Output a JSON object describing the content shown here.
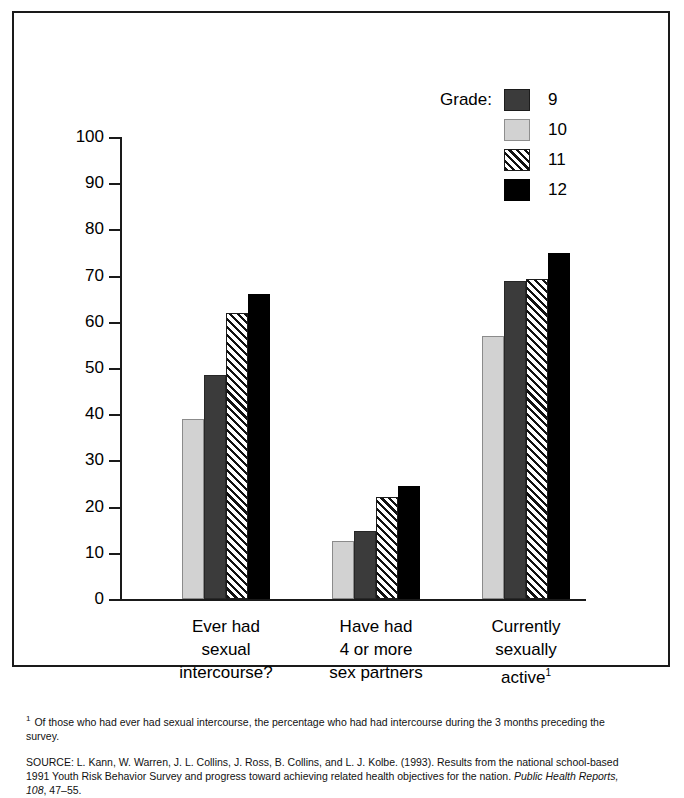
{
  "title": {
    "text_visible_tail": "Sexual Intercourse: Grade",
    "full_clipped": "Sexual Intercourse: Grade"
  },
  "legend": {
    "title": "Grade:",
    "entries": [
      {
        "label": "9",
        "swatch": "dark-gray-solid",
        "color": "#3b3b3b"
      },
      {
        "label": "10",
        "swatch": "light-gray-solid",
        "color": "#d2d2d2"
      },
      {
        "label": "11",
        "swatch": "diagonal-hatch",
        "color": "#ffffff"
      },
      {
        "label": "12",
        "swatch": "black-solid",
        "color": "#000000"
      }
    ]
  },
  "axis": {
    "y_ticks": [
      "100",
      "90",
      "80",
      "70",
      "60",
      "50",
      "40",
      "30",
      "20",
      "10",
      "0"
    ]
  },
  "categories": [
    {
      "line1": "Ever had",
      "line2": "sexual",
      "line3": "intercourse?",
      "sup": ""
    },
    {
      "line1": "Have had",
      "line2": "4 or more",
      "line3": "sex partners",
      "sup": ""
    },
    {
      "line1": "Currently",
      "line2": "sexually",
      "line3": "active",
      "sup": "1"
    }
  ],
  "footnote": {
    "marker": "1",
    "text": "Of those who had ever had sexual intercourse, the percentage who had had intercourse during the 3 months preceding the survey."
  },
  "source": {
    "lead": "SOURCE: L. Kann, W. Warren, J. L. Collins, J. Ross, B. Collins, and L. J. Kolbe. (1993). Results from the national school-based 1991 Youth Risk Behavior Survey and progress toward achieving related health objectives for the nation. ",
    "italic": "Public Health Reports, 108",
    "tail": ", 47–55."
  },
  "chart_data": {
    "type": "bar",
    "title": "Sexual Intercourse: Grade",
    "xlabel": "",
    "ylabel": "",
    "ylim": [
      0,
      100
    ],
    "grid": false,
    "legend_position": "top-right",
    "categories": [
      "Ever had sexual intercourse?",
      "Have had 4 or more sex partners",
      "Currently sexually active"
    ],
    "series": [
      {
        "name": "10",
        "key": "g10",
        "values": [
          39.0,
          12.5,
          57.0
        ]
      },
      {
        "name": "9",
        "key": "g9",
        "values": [
          48.5,
          14.8,
          68.8
        ]
      },
      {
        "name": "11",
        "key": "g11",
        "values": [
          62.0,
          22.0,
          69.3
        ]
      },
      {
        "name": "12",
        "key": "g12",
        "values": [
          66.0,
          24.5,
          75.0
        ]
      }
    ],
    "bar_order_left_to_right": [
      "10",
      "9",
      "11",
      "12"
    ]
  }
}
